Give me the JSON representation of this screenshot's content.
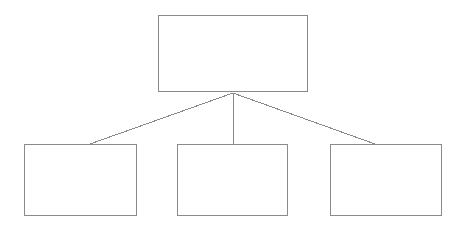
{
  "diagram": {
    "type": "hierarchy-tree",
    "orientation": "top-down",
    "background_color": "#ffffff",
    "stroke_color": "#8a8a8a",
    "stroke_width_px": 1,
    "canvas": {
      "width": 463,
      "height": 229
    },
    "parent": {
      "id": "parent-node",
      "label": "",
      "x": 158,
      "y": 15,
      "width": 150,
      "height": 77
    },
    "junction": {
      "x": 233,
      "y": 93
    },
    "children": [
      {
        "id": "child-node-1",
        "label": "",
        "x": 24,
        "y": 144,
        "width": 113,
        "height": 72,
        "connector_end": {
          "x": 90,
          "y": 144
        }
      },
      {
        "id": "child-node-2",
        "label": "",
        "x": 177,
        "y": 144,
        "width": 111,
        "height": 72,
        "connector_end": {
          "x": 233,
          "y": 144
        }
      },
      {
        "id": "child-node-3",
        "label": "",
        "x": 330,
        "y": 144,
        "width": 112,
        "height": 72,
        "connector_end": {
          "x": 375,
          "y": 144
        }
      }
    ]
  }
}
